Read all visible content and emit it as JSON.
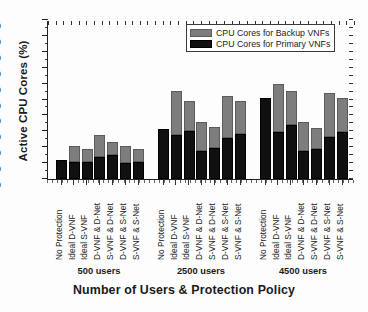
{
  "chart_data": {
    "type": "bar",
    "stacked": true,
    "title": "",
    "xlabel": "Number of Users & Protection Policy",
    "ylabel": "Active CPU Cores (%)",
    "ylim": [
      0,
      100
    ],
    "ytick_step": 10,
    "yticks": [
      0,
      10,
      20,
      30,
      40,
      50,
      60,
      70,
      80,
      90,
      100
    ],
    "grid": false,
    "legend_position": "top-right",
    "colors": {
      "backup": "#7d7d7d",
      "primary": "#101010"
    },
    "series": [
      {
        "name": "CPU Cores for Backup VNFs",
        "color": "#7d7d7d"
      },
      {
        "name": "CPU Cores for Primary VNFs",
        "color": "#101010"
      }
    ],
    "categories": [
      "No Protection",
      "Ideal D-VNF",
      "Ideal S-VNF",
      "D-VNF & D-Net",
      "S-VNF & D-Net",
      "D-VNF & S-Net",
      "S-VNF & S-Net"
    ],
    "groups": [
      {
        "label": "500 users",
        "primary": [
          12,
          10.5,
          11,
          14,
          15,
          10,
          10.5
        ],
        "backup": [
          0,
          10.5,
          8,
          14,
          8,
          10.5,
          8.5
        ],
        "total": [
          12,
          21,
          19,
          28,
          23,
          20.5,
          19
        ]
      },
      {
        "label": "2500 users",
        "primary": [
          31.5,
          27.5,
          30.5,
          17.5,
          19.5,
          26,
          28.5
        ],
        "backup": [
          0,
          28,
          18.5,
          18.5,
          13,
          26.5,
          20.5
        ],
        "total": [
          31.5,
          55.5,
          49,
          36,
          32.5,
          52.5,
          49
        ]
      },
      {
        "label": "4500 users",
        "primary": [
          51,
          29.5,
          34,
          17.5,
          19,
          26.5,
          29.5
        ],
        "backup": [
          0,
          30,
          21.5,
          18.5,
          13,
          27.5,
          21.5
        ],
        "total": [
          51,
          59.5,
          55.5,
          36,
          32,
          54,
          51
        ]
      }
    ]
  },
  "legend": {
    "backup_label": "CPU Cores for Backup VNFs",
    "primary_label": "CPU Cores for Primary VNFs"
  },
  "axis": {
    "y_title": "Active CPU Cores (%)",
    "x_title": "Number of Users & Protection Policy"
  }
}
